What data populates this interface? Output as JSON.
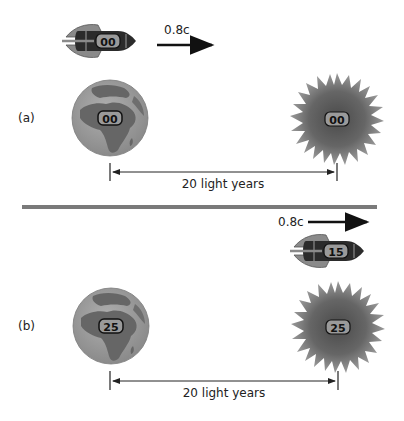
{
  "panels": [
    {
      "label": "(a)",
      "velocity_label": "0.8c",
      "rocket_clock": "00",
      "earth_clock": "00",
      "star_clock": "00",
      "distance_label": "20 light years"
    },
    {
      "label": "(b)",
      "velocity_label": "0.8c",
      "rocket_clock": "15",
      "earth_clock": "25",
      "star_clock": "25",
      "distance_label": "20 light years"
    }
  ],
  "colors": {
    "divider": "#7a7a7a",
    "rocket_body": "#2b2b2b",
    "rocket_fin": "#8a8a8a",
    "badge_fill": "#9a9a9a",
    "earth_ocean": "#9a9a9a",
    "earth_land": "#666666",
    "star_core": "#555555",
    "star_edge": "#8c8c8c"
  }
}
